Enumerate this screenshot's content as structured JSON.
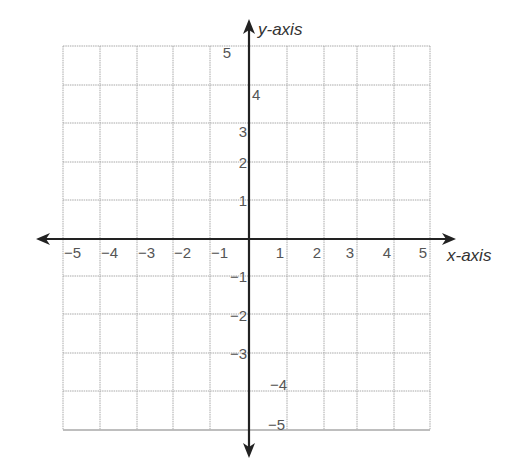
{
  "chart_data": {
    "type": "coordinate-grid",
    "title": "",
    "xlabel": "x-axis",
    "ylabel": "y-axis",
    "xlim": [
      -5,
      5
    ],
    "ylim": [
      -5,
      5
    ],
    "grid": true,
    "x_ticks": [
      -5,
      -4,
      -3,
      -2,
      -1,
      1,
      2,
      3,
      4,
      5
    ],
    "y_ticks": [
      5,
      4,
      3,
      2,
      1,
      -1,
      -2,
      -3,
      -4,
      -5
    ],
    "x_tick_labels": [
      "−5",
      "−4",
      "−3",
      "−2",
      "−1",
      "1",
      "2",
      "3",
      "4",
      "5"
    ],
    "y_tick_labels": [
      "5",
      "4",
      "3",
      "2",
      "1",
      "−1",
      "−2",
      "−3",
      "−4",
      "−5"
    ],
    "series": []
  },
  "axes": {
    "x_title": "x-axis",
    "y_title": "y-axis"
  },
  "colors": {
    "grid": "#a8a8a8",
    "axis": "#222222",
    "label": "#555555"
  }
}
